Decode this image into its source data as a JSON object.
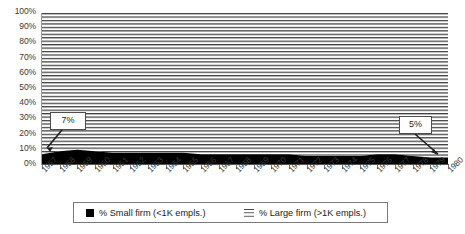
{
  "chart_data": {
    "type": "area",
    "title": "",
    "subtitle": "",
    "xlabel": "",
    "ylabel": "",
    "stacked": "100%",
    "grid": false,
    "legend_position": "bottom",
    "ylim": [
      0,
      100
    ],
    "y_ticks": [
      "0%",
      "10%",
      "20%",
      "30%",
      "40%",
      "50%",
      "60%",
      "70%",
      "80%",
      "90%",
      "100%"
    ],
    "y_tick_values": [
      0,
      10,
      20,
      30,
      40,
      50,
      60,
      70,
      80,
      90,
      100
    ],
    "categories": [
      "1957",
      "1958",
      "1959",
      "1960",
      "1961",
      "1962",
      "1963",
      "1964",
      "1965",
      "1966",
      "1967",
      "1968",
      "1969",
      "1970",
      "1971",
      "1972",
      "1973",
      "1974",
      "1975",
      "1976",
      "1977",
      "1978",
      "1979",
      "1980"
    ],
    "series": [
      {
        "name": "% Small firm (<1K empls.)",
        "color": "#000000",
        "fill": "solid",
        "values": [
          7,
          9,
          10,
          9,
          8,
          8,
          8,
          8,
          8,
          7,
          7,
          7,
          7,
          7,
          7,
          6,
          6,
          6,
          6,
          7,
          7,
          6,
          5,
          5
        ]
      },
      {
        "name": "% Large firm (>1K empls.)",
        "color": "#4a4a4a",
        "fill": "horizontal-lines",
        "values": [
          93,
          91,
          90,
          91,
          92,
          92,
          92,
          92,
          92,
          93,
          93,
          93,
          93,
          93,
          93,
          94,
          94,
          94,
          94,
          93,
          93,
          94,
          95,
          95
        ]
      }
    ],
    "annotations": [
      {
        "label": "7%",
        "series": "% Small firm (<1K empls.)",
        "category": "1957",
        "value": 7
      },
      {
        "label": "5%",
        "series": "% Small firm (<1K empls.)",
        "category": "1980",
        "value": 5
      }
    ]
  },
  "legend": {
    "entries": [
      {
        "label": "% Small firm (<1K empls.)",
        "swatch": "solid-black-square-icon"
      },
      {
        "label": "% Large firm (>1K empls.)",
        "swatch": "horizontal-lines-icon"
      }
    ]
  },
  "callouts": {
    "start": "7%",
    "end": "5%"
  },
  "colors": {
    "small_firm": "#000000",
    "large_firm_lines": "#4a4a4a",
    "plot_background": "#ffffff",
    "axis": "#555555",
    "text": "#3a3a3a"
  }
}
